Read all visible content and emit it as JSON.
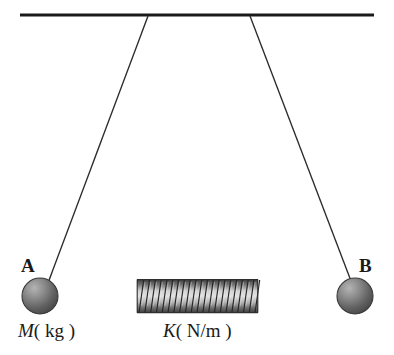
{
  "figure": {
    "background_color": "#ffffff",
    "width": 394,
    "height": 355
  },
  "ceiling": {
    "name": "ceiling-support-bar",
    "color": "#1a1a1a",
    "x1": 20,
    "y1": 15,
    "x2": 374,
    "y2": 15,
    "thickness": 3
  },
  "strings": [
    {
      "name": "left-string",
      "color": "#2b2b2b",
      "x1": 148,
      "y1": 16,
      "x2": 48,
      "y2": 282,
      "thickness": 1.3
    },
    {
      "name": "right-string",
      "color": "#2b2b2b",
      "x1": 250,
      "y1": 16,
      "x2": 351,
      "y2": 281,
      "thickness": 1.3
    }
  ],
  "masses": [
    {
      "name": "mass-ball-a",
      "label": "A",
      "quantity_symbol": "M",
      "quantity_unit": "( kg )",
      "cx": 40,
      "cy": 296,
      "r": 18,
      "fill_light": "#9a9a9a",
      "fill_dark": "#4e4e4e",
      "stroke": "#3a3a3a"
    },
    {
      "name": "mass-ball-b",
      "label": "B",
      "quantity_symbol": "",
      "quantity_unit": "",
      "cx": 355,
      "cy": 296,
      "r": 18,
      "fill_light": "#9a9a9a",
      "fill_dark": "#4e4e4e",
      "stroke": "#3a3a3a"
    }
  ],
  "rods": [
    {
      "name": "left-connector-rod",
      "color": "#6e6e6e",
      "x1": 56,
      "y1": 296,
      "x2": 137,
      "y2": 296,
      "thickness": 1.8
    },
    {
      "name": "right-connector-rod",
      "color": "#6e6e6e",
      "x1": 258,
      "y1": 296,
      "x2": 339,
      "y2": 296,
      "thickness": 1.8
    }
  ],
  "spring": {
    "name": "coil-spring",
    "symbol": "K",
    "unit": "( N/m )",
    "x_start": 137,
    "x_end": 258,
    "cy": 296,
    "top": 279,
    "bottom": 313,
    "coil_count": 21,
    "coil_stroke": "#262626",
    "highlight_color": "#d8d8d8",
    "shadow_color": "#3c3c3c",
    "body_color": "#8e8e8e"
  },
  "labels": {
    "point_a": "A",
    "point_b": "B",
    "mass_symbol": "M",
    "mass_unit": "( kg )",
    "spring_symbol": "K",
    "spring_unit": "( N/m )"
  }
}
